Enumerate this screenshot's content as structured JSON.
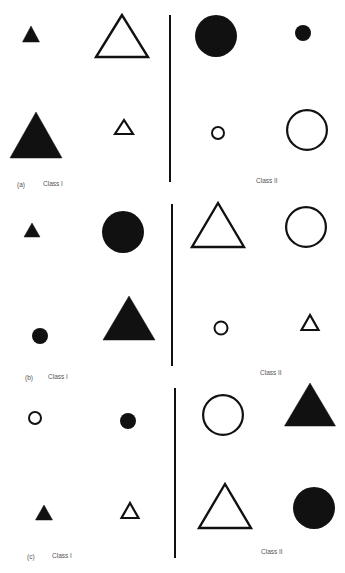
{
  "figure": {
    "ink_color": "#111111",
    "label_color": "#555555",
    "panels": [
      {
        "id": "a",
        "panel_label": "(a)",
        "class1_label": "Class I",
        "class2_label": "Class II",
        "panel_label_pos": [
          17,
          181
        ],
        "class1_label_pos": [
          43,
          180
        ],
        "class2_label_pos": [
          256,
          177
        ],
        "divider": {
          "x": 170,
          "y1": 15,
          "y2": 182
        },
        "class1_shapes": [
          {
            "shape": "triangle",
            "fill": "filled",
            "size": "small",
            "apex": [
              31,
              26
            ],
            "base_y": 42,
            "half_width": 8.5
          },
          {
            "shape": "triangle",
            "fill": "outline",
            "size": "large",
            "apex": [
              122,
              15
            ],
            "base_y": 57,
            "half_width": 26
          },
          {
            "shape": "triangle",
            "fill": "filled",
            "size": "large",
            "apex": [
              36,
              112
            ],
            "base_y": 158,
            "half_width": 26
          },
          {
            "shape": "triangle",
            "fill": "outline",
            "size": "small",
            "apex": [
              124,
              120
            ],
            "base_y": 134,
            "half_width": 9
          }
        ],
        "class2_shapes": [
          {
            "shape": "circle",
            "fill": "filled",
            "size": "large",
            "center": [
              216,
              36
            ],
            "r": 21
          },
          {
            "shape": "circle",
            "fill": "filled",
            "size": "small",
            "center": [
              303,
              33
            ],
            "r": 8
          },
          {
            "shape": "circle",
            "fill": "outline",
            "size": "small",
            "center": [
              218,
              133
            ],
            "r": 7
          },
          {
            "shape": "circle",
            "fill": "outline",
            "size": "large",
            "center": [
              307,
              130
            ],
            "r": 21
          }
        ]
      },
      {
        "id": "b",
        "panel_label": "(b)",
        "class1_label": "Class I",
        "class2_label": "Class II",
        "panel_label_pos": [
          25,
          374
        ],
        "class1_label_pos": [
          48,
          373
        ],
        "class2_label_pos": [
          260,
          369
        ],
        "divider": {
          "x": 172,
          "y1": 204,
          "y2": 366
        },
        "class1_shapes": [
          {
            "shape": "triangle",
            "fill": "filled",
            "size": "small",
            "apex": [
              32,
              223
            ],
            "base_y": 237,
            "half_width": 8
          },
          {
            "shape": "circle",
            "fill": "filled",
            "size": "large",
            "center": [
              123,
              232
            ],
            "r": 21
          },
          {
            "shape": "circle",
            "fill": "filled",
            "size": "small",
            "center": [
              40,
              336
            ],
            "r": 8
          },
          {
            "shape": "triangle",
            "fill": "filled",
            "size": "large",
            "apex": [
              129,
              296
            ],
            "base_y": 340,
            "half_width": 26
          }
        ],
        "class2_shapes": [
          {
            "shape": "triangle",
            "fill": "outline",
            "size": "large",
            "apex": [
              218,
              203
            ],
            "base_y": 247,
            "half_width": 26
          },
          {
            "shape": "circle",
            "fill": "outline",
            "size": "large",
            "center": [
              306,
              227
            ],
            "r": 21
          },
          {
            "shape": "circle",
            "fill": "outline",
            "size": "small",
            "center": [
              221,
              328
            ],
            "r": 7.5
          },
          {
            "shape": "triangle",
            "fill": "outline",
            "size": "small",
            "apex": [
              310,
              315
            ],
            "base_y": 330,
            "half_width": 8.5
          }
        ]
      },
      {
        "id": "c",
        "panel_label": "(c)",
        "class1_label": "Class I",
        "class2_label": "Class II",
        "panel_label_pos": [
          27,
          553
        ],
        "class1_label_pos": [
          52,
          552
        ],
        "class2_label_pos": [
          261,
          548
        ],
        "divider": {
          "x": 175,
          "y1": 388,
          "y2": 558
        },
        "class1_shapes": [
          {
            "shape": "circle",
            "fill": "outline",
            "size": "small",
            "center": [
              35,
              418
            ],
            "r": 7
          },
          {
            "shape": "circle",
            "fill": "filled",
            "size": "small",
            "center": [
              128,
              421
            ],
            "r": 8
          },
          {
            "shape": "triangle",
            "fill": "filled",
            "size": "small",
            "apex": [
              44,
              505
            ],
            "base_y": 520,
            "half_width": 8.5
          },
          {
            "shape": "triangle",
            "fill": "outline",
            "size": "small",
            "apex": [
              130,
              503
            ],
            "base_y": 518,
            "half_width": 8.5
          }
        ],
        "class2_shapes": [
          {
            "shape": "circle",
            "fill": "outline",
            "size": "large",
            "center": [
              223,
              415
            ],
            "r": 21
          },
          {
            "shape": "triangle",
            "fill": "filled",
            "size": "large",
            "apex": [
              310,
              383
            ],
            "base_y": 426,
            "half_width": 25.5
          },
          {
            "shape": "triangle",
            "fill": "outline",
            "size": "large",
            "apex": [
              225,
              484
            ],
            "base_y": 528,
            "half_width": 26
          },
          {
            "shape": "circle",
            "fill": "filled",
            "size": "large",
            "center": [
              314,
              508
            ],
            "r": 21
          }
        ]
      }
    ]
  }
}
